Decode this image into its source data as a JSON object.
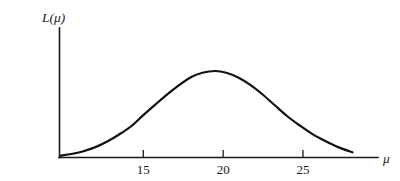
{
  "figure": {
    "background_color": "#ffffff",
    "ink_color": "#111111",
    "width": 400,
    "height": 181
  },
  "chart_data": {
    "type": "line",
    "title": "",
    "subtitle": "",
    "xlabel": "μ",
    "ylabel": "L(μ)",
    "grid": false,
    "legend": null,
    "xlim": [
      9.75,
      29.7
    ],
    "ylim": [
      0,
      1.08
    ],
    "xticks": [
      15,
      20,
      25
    ],
    "xtick_labels": [
      "15",
      "20",
      "25"
    ],
    "yticks": [],
    "ytick_labels": [],
    "annotations": [],
    "series": [
      {
        "name": "L(μ)",
        "color": "#111111",
        "peak_x": 19.5,
        "peak_y": 1.0,
        "x": [
          9.8,
          10.5,
          11.2,
          12.0,
          12.8,
          13.6,
          14.3,
          15.0,
          15.8,
          16.5,
          17.2,
          18.0,
          18.7,
          19.5,
          20.2,
          21.0,
          21.7,
          22.4,
          23.2,
          24.0,
          24.8,
          25.6,
          26.4,
          27.2,
          28.1
        ],
        "y": [
          0.02,
          0.04,
          0.07,
          0.12,
          0.19,
          0.28,
          0.37,
          0.49,
          0.62,
          0.73,
          0.83,
          0.93,
          0.98,
          1.0,
          0.98,
          0.92,
          0.84,
          0.74,
          0.61,
          0.48,
          0.37,
          0.27,
          0.19,
          0.12,
          0.06
        ]
      }
    ]
  },
  "labels": {
    "y_axis_title": "L(μ)",
    "x_axis_title": "μ",
    "tick_15": "15",
    "tick_20": "20",
    "tick_25": "25"
  }
}
